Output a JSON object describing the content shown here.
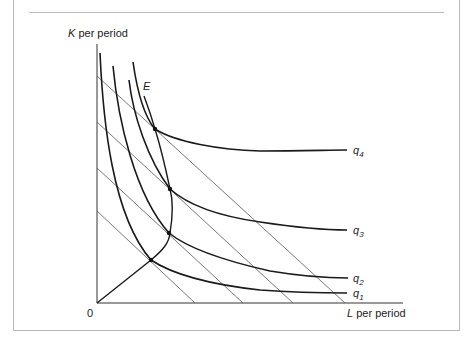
{
  "figure": {
    "y_axis_label_var": "K",
    "y_axis_label_rest": " per period",
    "x_axis_label_var": "L",
    "x_axis_label_rest": " per period",
    "origin_label": "0",
    "expansion_path_label": "E",
    "isoquants": [
      {
        "name": "q",
        "sub": "4"
      },
      {
        "name": "q",
        "sub": "3"
      },
      {
        "name": "q",
        "sub": "2"
      },
      {
        "name": "q",
        "sub": "1"
      }
    ],
    "isocost_lines_count": 4,
    "tangency_points_count": 4
  },
  "colors": {
    "curve": "#1a1a1a",
    "isocost": "#555555",
    "axis": "#333333",
    "frame": "#b8b8b8"
  }
}
